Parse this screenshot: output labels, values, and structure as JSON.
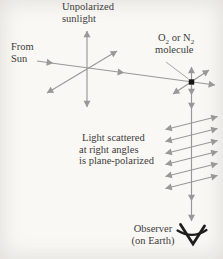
{
  "figure": {
    "type": "physics-diagram",
    "topic": "Unpolarized sunlight scattered by air molecules becomes plane-polarized",
    "background_color": "#f9f8f5",
    "line_color": "#989898",
    "text_color": "#3e3c3a",
    "dot_color": "#161616",
    "eye_color": "#1d1d1d",
    "labels": {
      "unpolarized": {
        "line1": "Unpolarized",
        "line2": "sunlight"
      },
      "from_sun": {
        "line1": "From",
        "line2": "Sun"
      },
      "molecule": {
        "part1": "O",
        "sub1": "2",
        "part2": " or N",
        "sub2": "2",
        "line2": "molecule"
      },
      "scattered": {
        "line1": "Light scattered",
        "line2": "at right angles",
        "line3": "is plane-polarized"
      },
      "observer": {
        "line1": "Observer",
        "line2": "(on Earth)"
      }
    },
    "icons": {
      "eye": "observer-eye-icon",
      "molecule_dot": "molecule-dot-icon",
      "arrows": "double-headed-polarization-arrow-icons"
    }
  }
}
